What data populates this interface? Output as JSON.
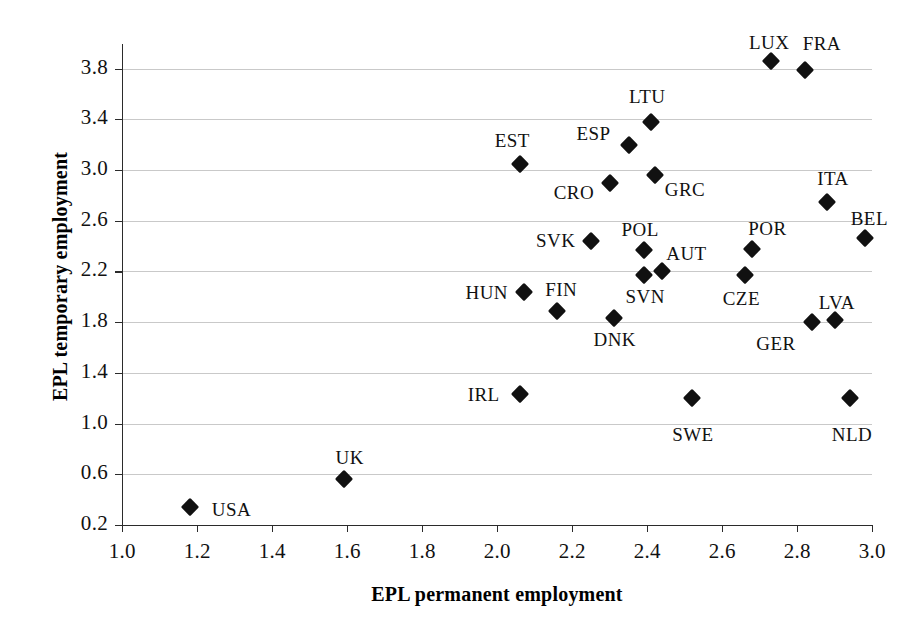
{
  "chart_data": {
    "type": "scatter",
    "title": "",
    "xlabel": "EPL permanent employment",
    "ylabel": "EPL temporary employment",
    "xlim": [
      1.0,
      3.0
    ],
    "ylim": [
      0.2,
      3.8
    ],
    "grid": true,
    "legend": "none",
    "marker_style": "filled-diamond",
    "marker_color": "#111111",
    "grid_color": "#c9c9c9",
    "axis_color": "#2b2b2b",
    "xticks": [
      "1.0",
      "1.2",
      "1.4",
      "1.6",
      "1.8",
      "2.0",
      "2.2",
      "2.4",
      "2.6",
      "2.8",
      "3.0"
    ],
    "yticks": [
      "0.2",
      "0.6",
      "1.0",
      "1.4",
      "1.8",
      "2.2",
      "2.6",
      "3.0",
      "3.4",
      "3.8"
    ],
    "points": [
      {
        "label": "USA",
        "x": 1.18,
        "y": 0.34,
        "lx": 22,
        "ly": -8
      },
      {
        "label": "UK",
        "x": 1.59,
        "y": 0.56,
        "lx": -8,
        "ly": -32
      },
      {
        "label": "IRL",
        "x": 2.06,
        "y": 1.23,
        "lx": -52,
        "ly": -10
      },
      {
        "label": "EST",
        "x": 2.06,
        "y": 3.05,
        "lx": -25,
        "ly": -34
      },
      {
        "label": "HUN",
        "x": 2.07,
        "y": 2.04,
        "lx": -58,
        "ly": -10
      },
      {
        "label": "FIN",
        "x": 2.16,
        "y": 1.89,
        "lx": -12,
        "ly": -32
      },
      {
        "label": "SVK",
        "x": 2.25,
        "y": 2.44,
        "lx": -55,
        "ly": -11
      },
      {
        "label": "CRO",
        "x": 2.3,
        "y": 2.9,
        "lx": -56,
        "ly": -1
      },
      {
        "label": "DNK",
        "x": 2.31,
        "y": 1.83,
        "lx": -20,
        "ly": 11
      },
      {
        "label": "ESP",
        "x": 2.35,
        "y": 3.2,
        "lx": -52,
        "ly": -22
      },
      {
        "label": "POL",
        "x": 2.39,
        "y": 2.37,
        "lx": -22,
        "ly": -31
      },
      {
        "label": "SVN",
        "x": 2.39,
        "y": 2.17,
        "lx": -18,
        "ly": 11
      },
      {
        "label": "LTU",
        "x": 2.41,
        "y": 3.38,
        "lx": -22,
        "ly": -36
      },
      {
        "label": "GRC",
        "x": 2.42,
        "y": 2.96,
        "lx": 10,
        "ly": 4
      },
      {
        "label": "AUT",
        "x": 2.44,
        "y": 2.2,
        "lx": 4,
        "ly": -28
      },
      {
        "label": "SWE",
        "x": 2.52,
        "y": 1.2,
        "lx": -20,
        "ly": 26
      },
      {
        "label": "CZE",
        "x": 2.66,
        "y": 2.17,
        "lx": -22,
        "ly": 13
      },
      {
        "label": "POR",
        "x": 2.68,
        "y": 2.38,
        "lx": -4,
        "ly": -31
      },
      {
        "label": "LUX",
        "x": 2.73,
        "y": 3.86,
        "lx": -22,
        "ly": -29
      },
      {
        "label": "FRA",
        "x": 2.82,
        "y": 3.79,
        "lx": -2,
        "ly": -37
      },
      {
        "label": "GER",
        "x": 2.84,
        "y": 1.8,
        "lx": -56,
        "ly": 11
      },
      {
        "label": "ITA",
        "x": 2.88,
        "y": 2.75,
        "lx": -10,
        "ly": -34
      },
      {
        "label": "LVA",
        "x": 2.9,
        "y": 1.82,
        "lx": -16,
        "ly": -28
      },
      {
        "label": "NLD",
        "x": 2.94,
        "y": 1.2,
        "lx": -18,
        "ly": 26
      },
      {
        "label": "BEL",
        "x": 2.98,
        "y": 2.46,
        "lx": -14,
        "ly": -30
      }
    ]
  }
}
